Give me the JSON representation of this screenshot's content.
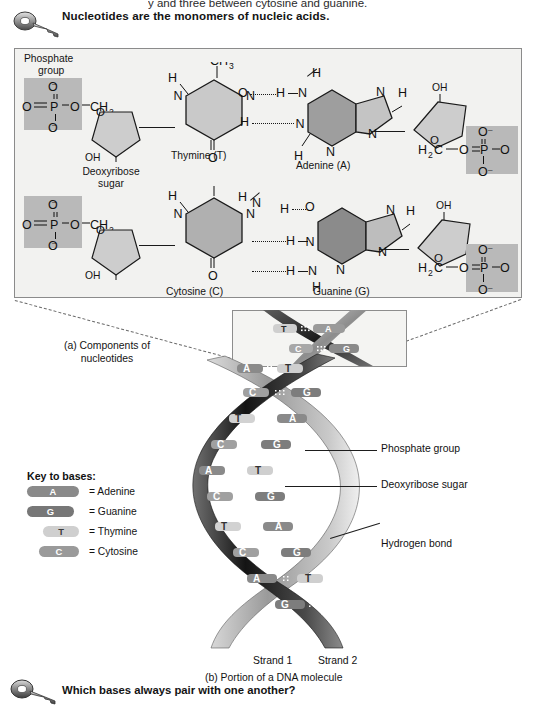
{
  "page": {
    "clipped_top_line": "y              and three between cytosine and guanine.",
    "statement": "Nucleotides are the monomers of nucleic acids.",
    "question": "Which bases always pair with one another?",
    "key_icon_name": "key-icon",
    "question_icon_name": "key-icon"
  },
  "panel_a": {
    "caption": "(a) Components of",
    "caption_line2": "nucleotides",
    "labels": {
      "phosphate_group_1": "Phosphate",
      "phosphate_group_2": "group",
      "deoxyribose_1": "Deoxyribose",
      "deoxyribose_2": "sugar",
      "thymine": "Thymine (T)",
      "adenine": "Adenine (A)",
      "cytosine": "Cytosine (C)",
      "guanine": "Guanine (G)"
    },
    "atoms": {
      "O": "O",
      "O_minus": "O–",
      "P": "P",
      "N": "N",
      "H": "H",
      "C": "C",
      "OH": "OH",
      "CH2": "CH2",
      "CH3": "CH3",
      "H2C": "H2C"
    }
  },
  "inset": {
    "pairs": [
      {
        "left": "T",
        "right": "A"
      },
      {
        "left": "C",
        "right": "G"
      }
    ]
  },
  "key_to_bases": {
    "title": "Key to bases:",
    "items": [
      {
        "letter": "A",
        "equals": "= Adenine",
        "color": "#8a8a8a",
        "width": 52,
        "type": "purine"
      },
      {
        "letter": "G",
        "equals": "= Guanine",
        "color": "#777777",
        "width": 47,
        "type": "purine"
      },
      {
        "letter": "T",
        "equals": "= Thymine",
        "color": "#cfcfcf",
        "width": 36,
        "type": "pyrimidine"
      },
      {
        "letter": "C",
        "equals": "= Cytosine",
        "color": "#9a9a9a",
        "width": 40,
        "type": "pyrimidine"
      }
    ]
  },
  "helix": {
    "callouts": [
      {
        "label": "Phosphate group"
      },
      {
        "label": "Deoxyribose sugar"
      },
      {
        "label": "Hydrogen bond"
      }
    ],
    "base_pairs": [
      {
        "left": "A",
        "right": "T"
      },
      {
        "left": "C",
        "right": "G"
      },
      {
        "left": "T",
        "right": "A"
      },
      {
        "left": "C",
        "right": "G"
      },
      {
        "left": "A",
        "right": "T"
      },
      {
        "left": "T",
        "right": "A"
      },
      {
        "left": "C",
        "right": "G"
      },
      {
        "left": "A",
        "right": "T"
      },
      {
        "left": "G",
        "right": "C"
      }
    ],
    "strand1": "Strand 1",
    "strand2": "Strand 2",
    "caption": "(b) Portion of a DNA molecule"
  }
}
